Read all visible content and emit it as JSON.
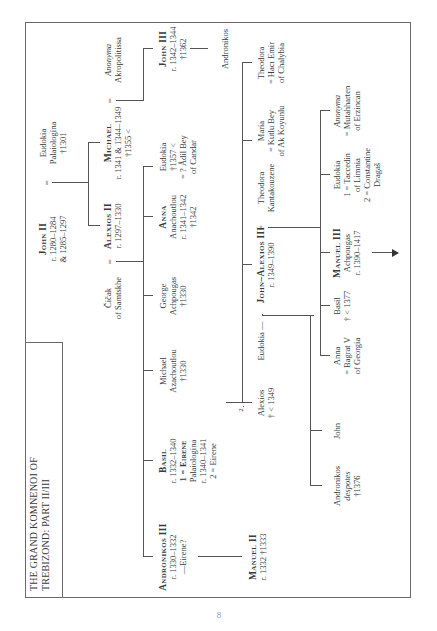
{
  "title": [
    "THE GRAND KOMNENOI OF",
    "TREBIZOND: PART II/III"
  ],
  "page_number": "8",
  "generation1": {
    "john_ii": {
      "name": "John II",
      "lines": [
        "r. 1280–1284",
        "& 1285–1297"
      ]
    },
    "eq": "=",
    "eudokia": {
      "name": "Eudokia",
      "lines": [
        "Palaiologina",
        "†1301"
      ]
    }
  },
  "generation2": {
    "cicak": {
      "name": "Čičak",
      "lines": [
        "of Samtskhe"
      ]
    },
    "eq1": "=",
    "alexios_ii": {
      "name": "Alexios II",
      "lines": [
        "r. 1297–1330"
      ]
    },
    "michael": {
      "name": "Michael",
      "lines": [
        "r. 1341 & 1344–1349",
        "†1355 <"
      ]
    },
    "eq2": "=",
    "anonyma": {
      "name": "Anonyma",
      "lines": [
        "Akropolitissa"
      ]
    }
  },
  "generation3": {
    "andronikos_iii": {
      "name": "Andronikos III",
      "lines": [
        "r. 1330–1332",
        "—Eirene?"
      ]
    },
    "basil": {
      "name": "Basil",
      "lines": [
        "r. 1332–1340",
        "1 = Eirene",
        "Palaiologina",
        "r. 1340–1341",
        "2 = Eirene"
      ],
      "marker": "2"
    },
    "michael_az": {
      "name": "Michael",
      "lines": [
        "Azachoutlou",
        "†1330"
      ]
    },
    "george": {
      "name": "George",
      "lines": [
        "Achpougas",
        "†1330"
      ]
    },
    "anna": {
      "name": "Anna",
      "lines": [
        "Anachoutlou",
        "r. 1341–1342",
        "†1342"
      ]
    },
    "eudokia_candar": {
      "name": "Eudokia",
      "lines": [
        "†1357 <",
        "= ? Âdil Bey",
        "of Candar"
      ]
    },
    "john_iii": {
      "name": "John III",
      "lines": [
        "r. 1342–1344",
        "†1362"
      ]
    },
    "andronikos_son": {
      "name": "Andronikos"
    }
  },
  "generation4": {
    "manuel_ii": {
      "name": "Manuel II",
      "lines": [
        "r. 1332 †1333"
      ]
    },
    "alexios": {
      "name": "Alexios",
      "lines": [
        "† < 1349"
      ]
    },
    "eudokia": {
      "name": "Eudokia",
      "dash": "—"
    },
    "alexios_iii": {
      "name": "John–Alexios III",
      "lines": [
        "r. 1349–1390"
      ]
    },
    "eq": "=",
    "theodora_k": {
      "name": "Theodora",
      "lines": [
        "Kantakouzene"
      ]
    },
    "maria": {
      "name": "Maria",
      "lines": [
        "= Kutlu Bey",
        "of Ak Koyunlu"
      ]
    },
    "theodora_h": {
      "name": "Theodora",
      "lines": [
        "= Hacı Emir",
        "of Chalybia"
      ]
    }
  },
  "generation5": {
    "andronikos": {
      "name": "Andronikos",
      "lines": [
        "despotes",
        "†1376"
      ]
    },
    "john": {
      "name": "John"
    },
    "anna": {
      "name": "Anna",
      "lines": [
        "= Bagrat V",
        "of Georgia"
      ]
    },
    "basil": {
      "name": "Basil",
      "lines": [
        "† < 1377"
      ]
    },
    "manuel_iii": {
      "name": "Manuel III",
      "lines": [
        "Achpougas",
        "r. 1390–1417"
      ]
    },
    "eudokia": {
      "name": "Eudokia",
      "lines": [
        "1 = Taccedin",
        "of Limnia",
        "2 = Constantine",
        "Dragaš"
      ]
    },
    "anonyma": {
      "name": "Anonyma",
      "lines": [
        "= Mutahharten",
        "of Erzincan"
      ]
    }
  },
  "continuation_arrow": "→"
}
